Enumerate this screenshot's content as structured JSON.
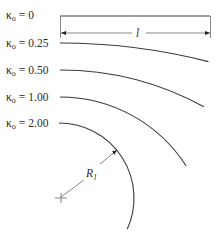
{
  "diagram": {
    "type": "curvature-arcs",
    "curves": [
      {
        "symbol": "κ",
        "subscript": "o",
        "equals": "=",
        "value": "0",
        "label": "κo = 0"
      },
      {
        "symbol": "κ",
        "subscript": "o",
        "equals": "=",
        "value": "0.25",
        "label": "κo = 0.25"
      },
      {
        "symbol": "κ",
        "subscript": "o",
        "equals": "=",
        "value": "0.50",
        "label": "κo = 0.50"
      },
      {
        "symbol": "κ",
        "subscript": "o",
        "equals": "=",
        "value": "1.00",
        "label": "κo = 1.00"
      },
      {
        "symbol": "κ",
        "subscript": "o",
        "equals": "=",
        "value": "2.00",
        "label": "κo = 2.00"
      }
    ],
    "length_dimension": {
      "label": "l"
    },
    "radius_dimension": {
      "label": "R",
      "subscript": "l"
    },
    "colors": {
      "line": "#3a3a3a",
      "dimension": "#6a6a6a",
      "text": "#2a2a2a",
      "background": "#ffffff"
    }
  }
}
